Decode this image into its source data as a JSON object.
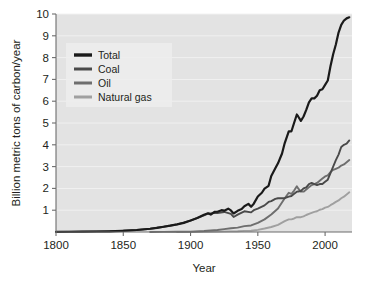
{
  "chart_data": {
    "type": "line",
    "title": "",
    "xlabel": "Year",
    "ylabel": "Billion metric tons of carbon/year",
    "xlim": [
      1800,
      2020
    ],
    "ylim": [
      0,
      10
    ],
    "xticks": [
      1800,
      1850,
      1900,
      1950,
      2000
    ],
    "yticks": [
      1,
      2,
      3,
      4,
      5,
      6,
      7,
      8,
      9,
      10
    ],
    "grid": true,
    "legend_position": "upper-left",
    "legend_entries": [
      {
        "label": "Total",
        "color": "#1a1a1a"
      },
      {
        "label": "Coal",
        "color": "#4a4a4a"
      },
      {
        "label": "Oil",
        "color": "#6e6e6e"
      },
      {
        "label": "Natural gas",
        "color": "#a0a0a0"
      }
    ],
    "series": [
      {
        "name": "Total",
        "color": "#1a1a1a",
        "x": [
          1800,
          1810,
          1820,
          1830,
          1840,
          1850,
          1860,
          1870,
          1875,
          1880,
          1885,
          1890,
          1895,
          1900,
          1905,
          1910,
          1913,
          1915,
          1918,
          1920,
          1923,
          1925,
          1928,
          1930,
          1932,
          1935,
          1938,
          1940,
          1943,
          1945,
          1947,
          1950,
          1953,
          1955,
          1958,
          1960,
          1963,
          1965,
          1968,
          1970,
          1973,
          1975,
          1977,
          1979,
          1980,
          1982,
          1984,
          1986,
          1988,
          1990,
          1992,
          1994,
          1996,
          1998,
          2000,
          2002,
          2004,
          2006,
          2008,
          2010,
          2012,
          2014,
          2016,
          2018
        ],
        "y": [
          0.008,
          0.011,
          0.015,
          0.022,
          0.033,
          0.054,
          0.091,
          0.15,
          0.19,
          0.24,
          0.29,
          0.35,
          0.42,
          0.53,
          0.64,
          0.79,
          0.86,
          0.8,
          0.93,
          0.93,
          1.0,
          0.98,
          1.07,
          0.99,
          0.85,
          0.97,
          1.05,
          1.18,
          1.29,
          1.16,
          1.3,
          1.63,
          1.8,
          1.99,
          2.12,
          2.57,
          2.92,
          3.15,
          3.6,
          4.08,
          4.62,
          4.62,
          5.01,
          5.39,
          5.3,
          5.1,
          5.3,
          5.6,
          5.95,
          6.13,
          6.13,
          6.25,
          6.5,
          6.55,
          6.75,
          6.95,
          7.6,
          8.15,
          8.6,
          9.15,
          9.5,
          9.7,
          9.8,
          9.85
        ]
      },
      {
        "name": "Coal",
        "color": "#4a4a4a",
        "x": [
          1800,
          1820,
          1840,
          1860,
          1870,
          1880,
          1890,
          1900,
          1910,
          1913,
          1918,
          1920,
          1925,
          1930,
          1932,
          1935,
          1940,
          1945,
          1947,
          1950,
          1955,
          1958,
          1960,
          1963,
          1965,
          1968,
          1970,
          1973,
          1975,
          1977,
          1979,
          1980,
          1982,
          1984,
          1986,
          1988,
          1990,
          1992,
          1994,
          1996,
          1998,
          2000,
          2002,
          2004,
          2006,
          2008,
          2010,
          2012,
          2014,
          2016,
          2018
        ],
        "y": [
          0.008,
          0.015,
          0.033,
          0.091,
          0.15,
          0.24,
          0.35,
          0.52,
          0.76,
          0.84,
          0.88,
          0.87,
          0.92,
          0.83,
          0.69,
          0.8,
          0.95,
          0.9,
          1.0,
          1.07,
          1.22,
          1.38,
          1.42,
          1.52,
          1.55,
          1.55,
          1.55,
          1.62,
          1.65,
          1.75,
          1.85,
          1.86,
          1.88,
          2.0,
          2.05,
          2.2,
          2.25,
          2.2,
          2.15,
          2.2,
          2.2,
          2.3,
          2.4,
          2.7,
          3.0,
          3.3,
          3.55,
          3.9,
          4.0,
          4.05,
          4.2
        ]
      },
      {
        "name": "Oil",
        "color": "#6e6e6e",
        "x": [
          1870,
          1880,
          1890,
          1900,
          1910,
          1920,
          1925,
          1930,
          1935,
          1940,
          1945,
          1950,
          1955,
          1960,
          1965,
          1970,
          1973,
          1975,
          1977,
          1979,
          1980,
          1982,
          1984,
          1986,
          1988,
          1990,
          1992,
          1994,
          1996,
          1998,
          2000,
          2002,
          2004,
          2006,
          2008,
          2010,
          2012,
          2014,
          2016,
          2018
        ],
        "y": [
          0.001,
          0.004,
          0.01,
          0.018,
          0.045,
          0.09,
          0.13,
          0.17,
          0.2,
          0.27,
          0.3,
          0.42,
          0.58,
          0.8,
          1.08,
          1.55,
          1.8,
          1.75,
          1.9,
          2.1,
          2.0,
          1.85,
          1.85,
          1.95,
          2.05,
          2.15,
          2.2,
          2.25,
          2.35,
          2.45,
          2.55,
          2.6,
          2.75,
          2.85,
          2.9,
          2.95,
          3.05,
          3.1,
          3.2,
          3.3
        ]
      },
      {
        "name": "Natural gas",
        "color": "#a0a0a0",
        "x": [
          1890,
          1900,
          1910,
          1920,
          1930,
          1935,
          1940,
          1945,
          1950,
          1955,
          1960,
          1965,
          1970,
          1973,
          1975,
          1977,
          1979,
          1980,
          1982,
          1984,
          1986,
          1988,
          1990,
          1992,
          1994,
          1996,
          1998,
          2000,
          2002,
          2004,
          2006,
          2008,
          2010,
          2012,
          2014,
          2016,
          2018
        ],
        "y": [
          0.001,
          0.003,
          0.008,
          0.015,
          0.03,
          0.035,
          0.05,
          0.06,
          0.1,
          0.16,
          0.23,
          0.33,
          0.5,
          0.58,
          0.58,
          0.62,
          0.68,
          0.68,
          0.68,
          0.72,
          0.78,
          0.83,
          0.88,
          0.92,
          0.95,
          1.02,
          1.05,
          1.12,
          1.15,
          1.23,
          1.3,
          1.38,
          1.45,
          1.55,
          1.62,
          1.72,
          1.82
        ]
      }
    ]
  },
  "style": {
    "plot_background": "#e3e3e3",
    "page_background": "#ffffff",
    "gridline_color": "#f2f2f2",
    "axis_color": "#6d6d6d",
    "text_color": "#231f20",
    "legend_background": "#ededed"
  }
}
